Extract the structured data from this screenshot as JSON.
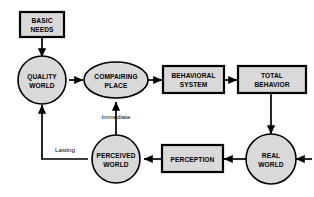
{
  "diagram": {
    "colors": {
      "node_fill": "#d9d9d9",
      "stroke": "#000000",
      "background": "#ffffff"
    },
    "nodes": [
      {
        "id": "basic-needs",
        "shape": "rectangle",
        "line1": "BASIC",
        "line2": "NEEDS"
      },
      {
        "id": "quality-world",
        "shape": "circle",
        "line1": "QUALITY",
        "line2": "WORLD"
      },
      {
        "id": "compairing-place",
        "shape": "ellipse",
        "line1": "COMPAIRING",
        "line2": "PLACE"
      },
      {
        "id": "behavioral-system",
        "shape": "rectangle",
        "line1": "BEHAVIORAL",
        "line2": "SYSTEM"
      },
      {
        "id": "total-behavior",
        "shape": "rectangle",
        "line1": "TOTAL",
        "line2": "BEHAVIOR"
      },
      {
        "id": "real-world",
        "shape": "circle",
        "line1": "REAL",
        "line2": "WORLD"
      },
      {
        "id": "perception",
        "shape": "rectangle",
        "line1": "PERCEPTION",
        "line2": ""
      },
      {
        "id": "perceived-world",
        "shape": "circle",
        "line1": "PERCEIVED",
        "line2": "WORLD"
      }
    ],
    "edge_labels": {
      "immediate": "Immediate",
      "lasting": "Lasting"
    }
  }
}
